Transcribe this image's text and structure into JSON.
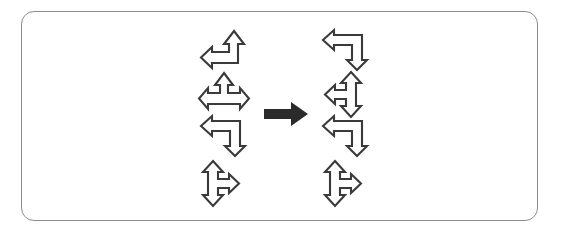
{
  "figure": {
    "background_color": "#ffffff",
    "frame": {
      "name": "rounded-rectangle-border",
      "stroke_color": "#8d8d8d",
      "corner_radius": "13px",
      "x": 21,
      "y": 11,
      "width": 517,
      "height": 210
    },
    "operator": {
      "name": "rightwards-arrow",
      "symbol": "→",
      "color": "#2b2b2b",
      "x": 264,
      "y": 100,
      "width": 44,
      "height": 26
    },
    "left_column": {
      "label": "input-shapes",
      "x": 196,
      "items": [
        {
          "id": "left-1",
          "type": "elbow-arrow",
          "description": "elbow arrow pointing up at top-right and left at bottom-left",
          "heads": [
            "up",
            "left"
          ],
          "y": 27
        },
        {
          "id": "left-2",
          "type": "tee-arrow",
          "description": "horizontal double-headed arrow with upward branch from center",
          "heads": [
            "left",
            "right",
            "up"
          ],
          "y": 70
        },
        {
          "id": "left-3",
          "type": "elbow-arrow",
          "description": "elbow arrow pointing left at top-left and down at bottom-right",
          "heads": [
            "left",
            "down"
          ],
          "y": 113
        },
        {
          "id": "left-4",
          "type": "tee-arrow",
          "description": "vertical double-headed arrow with rightward branch from center",
          "heads": [
            "up",
            "down",
            "right"
          ],
          "y": 158
        }
      ]
    },
    "right_column": {
      "label": "output-shapes",
      "x": 318,
      "items": [
        {
          "id": "right-1",
          "type": "elbow-arrow",
          "description": "elbow arrow pointing left at top-left and down at bottom-right",
          "heads": [
            "left",
            "down"
          ],
          "y": 27
        },
        {
          "id": "right-2",
          "type": "tee-arrow",
          "description": "vertical double-headed arrow with leftward branch from center",
          "heads": [
            "up",
            "down",
            "left"
          ],
          "y": 70
        },
        {
          "id": "right-3",
          "type": "elbow-arrow",
          "description": "elbow arrow pointing left at top-left and down at bottom-right",
          "heads": [
            "left",
            "down"
          ],
          "y": 113
        },
        {
          "id": "right-4",
          "type": "tee-arrow",
          "description": "vertical double-headed arrow with rightward branch from center",
          "heads": [
            "up",
            "down",
            "right"
          ],
          "y": 158
        }
      ]
    },
    "colors": {
      "outline_stroke": "#3a3a3a",
      "outline_fill": "#ffffff",
      "solid_arrow": "#2b2b2b",
      "frame_stroke": "#8d8d8d"
    }
  }
}
